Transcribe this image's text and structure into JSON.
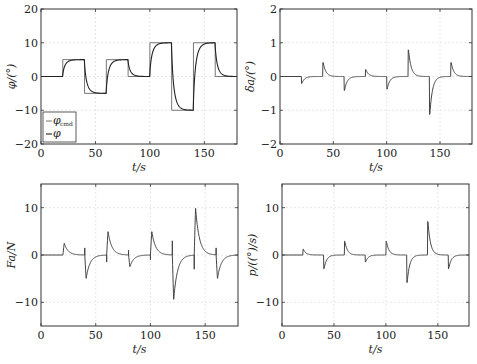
{
  "chart_data": [
    {
      "type": "line",
      "id": "phi",
      "xlabel": "t/s",
      "ylabel": "φ/(°)",
      "xlim": [
        0,
        180
      ],
      "ylim": [
        -20,
        20
      ],
      "xticks": [
        0,
        50,
        100,
        150
      ],
      "yticks": [
        -20,
        -10,
        0,
        10,
        20
      ],
      "grid": true,
      "legend": {
        "position": "lower left",
        "entries": [
          "φ_cmd",
          "φ"
        ]
      },
      "series": [
        {
          "name": "φ_cmd",
          "style": "step",
          "x": [
            0,
            20,
            20,
            40,
            40,
            60,
            60,
            80,
            80,
            100,
            100,
            120,
            120,
            140,
            140,
            160,
            160,
            180
          ],
          "values": [
            0,
            0,
            5,
            5,
            -5,
            -5,
            5,
            5,
            0,
            0,
            10,
            10,
            -10,
            -10,
            10,
            10,
            0,
            0
          ]
        },
        {
          "name": "φ",
          "style": "first-order response",
          "tau": 3
        }
      ]
    },
    {
      "type": "line",
      "id": "delta_a",
      "xlabel": "t/s",
      "ylabel": "δa/(°)",
      "xlim": [
        0,
        180
      ],
      "ylim": [
        -2,
        2
      ],
      "xticks": [
        0,
        50,
        100,
        150
      ],
      "yticks": [
        -2,
        -1,
        0,
        1,
        2
      ],
      "grid": true,
      "series": [
        {
          "name": "δa",
          "spikes": [
            {
              "t": 20,
              "v": -0.25
            },
            {
              "t": 40,
              "v": 0.5
            },
            {
              "t": 60,
              "v": -0.5
            },
            {
              "t": 80,
              "v": 0.25
            },
            {
              "t": 100,
              "v": -0.45
            },
            {
              "t": 120,
              "v": 0.95
            },
            {
              "t": 140,
              "v": -1.35
            },
            {
              "t": 160,
              "v": 0.5
            }
          ]
        }
      ]
    },
    {
      "type": "line",
      "id": "Fa",
      "xlabel": "t/s",
      "ylabel": "Fa/N",
      "xlim": [
        0,
        180
      ],
      "ylim": [
        -15,
        15
      ],
      "xticks": [
        0,
        50,
        100,
        150
      ],
      "yticks": [
        -10,
        0,
        10
      ],
      "grid": true,
      "series": [
        {
          "name": "Fa",
          "spikes": [
            {
              "t": 20,
              "v": 2.5,
              "pre": 0
            },
            {
              "t": 40,
              "v": -5,
              "pre": 1.5
            },
            {
              "t": 60,
              "v": 5,
              "pre": -1.5
            },
            {
              "t": 80,
              "v": -2.5,
              "pre": 1
            },
            {
              "t": 100,
              "v": 5,
              "pre": -1
            },
            {
              "t": 120,
              "v": -9.5,
              "pre": 3
            },
            {
              "t": 140,
              "v": 10,
              "pre": -3
            },
            {
              "t": 160,
              "v": -5,
              "pre": 1.5
            }
          ]
        }
      ]
    },
    {
      "type": "line",
      "id": "p",
      "xlabel": "t/s",
      "ylabel": "p/((°)/s)",
      "xlim": [
        0,
        180
      ],
      "ylim": [
        -15,
        15
      ],
      "xticks": [
        0,
        50,
        100,
        150
      ],
      "yticks": [
        -10,
        0,
        10
      ],
      "grid": true,
      "series": [
        {
          "name": "p",
          "spikes": [
            {
              "t": 20,
              "v": 1.5
            },
            {
              "t": 40,
              "v": -3.5
            },
            {
              "t": 60,
              "v": 3.5
            },
            {
              "t": 80,
              "v": -1.8
            },
            {
              "t": 100,
              "v": 3.5
            },
            {
              "t": 120,
              "v": -7
            },
            {
              "t": 140,
              "v": 8.5
            },
            {
              "t": 160,
              "v": -3.5
            }
          ]
        }
      ]
    }
  ]
}
